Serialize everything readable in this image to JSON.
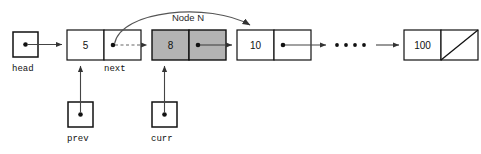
{
  "diagram": {
    "annotation": {
      "node_n_label": "Node N"
    },
    "pointers": [
      {
        "name": "head",
        "label": "head",
        "x": 13,
        "y": 32,
        "size": 22
      },
      {
        "name": "prev",
        "label": "prev",
        "x": 68,
        "y": 102,
        "size": 22
      },
      {
        "name": "curr",
        "label": "curr",
        "x": 152,
        "y": 102,
        "size": 22
      }
    ],
    "nodes": [
      {
        "name": "node-5",
        "value": "5",
        "shaded": false,
        "x": 67,
        "y": 30,
        "width": 74,
        "height": 30,
        "next_label": "next",
        "null_terminated": false
      },
      {
        "name": "node-8",
        "value": "8",
        "shaded": true,
        "x": 152,
        "y": 30,
        "width": 74,
        "height": 30,
        "next_label": "",
        "null_terminated": false
      },
      {
        "name": "node-10",
        "value": "10",
        "shaded": false,
        "x": 237,
        "y": 30,
        "width": 74,
        "height": 30,
        "next_label": "",
        "null_terminated": false
      },
      {
        "name": "node-100",
        "value": "100",
        "shaded": false,
        "x": 404,
        "y": 30,
        "width": 74,
        "height": 30,
        "next_label": "",
        "null_terminated": true
      }
    ],
    "ellipsis": {
      "name": "list-continues-ellipsis",
      "dot_count": 4,
      "x_start": 334,
      "y": 45,
      "spacing": 9
    },
    "colors": {
      "background": "#ffffff",
      "stroke": "#111111",
      "shaded_fill": "#b3b3b3",
      "link": "#444444",
      "dashed_link": "#666666",
      "text": "#111111"
    }
  }
}
